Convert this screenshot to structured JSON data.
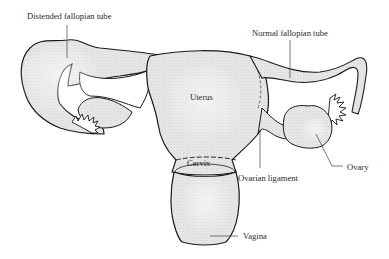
{
  "diagram": {
    "type": "anatomical illustration",
    "colors": {
      "fill": "#e6e6e6",
      "outline": "#1a1a1a",
      "leader": "#444444",
      "text": "#2a2a2a"
    },
    "labels": {
      "distended_tube": "Distended fallopian tube",
      "normal_tube": "Normal fallopian tube",
      "uterus": "Uterus",
      "cervix": "Cervix",
      "ovarian_ligament": "Ovarian ligament",
      "ovary": "Ovary",
      "vagina": "Vagina"
    }
  }
}
